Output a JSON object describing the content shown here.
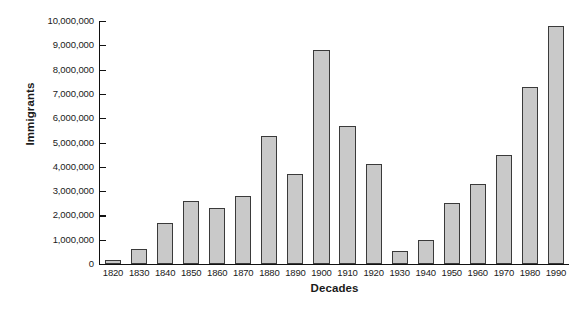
{
  "chart_data": {
    "type": "bar",
    "title": "",
    "xlabel": "Decades",
    "ylabel": "Immigrants",
    "categories": [
      "1820",
      "1830",
      "1840",
      "1850",
      "1860",
      "1870",
      "1880",
      "1890",
      "1900",
      "1910",
      "1920",
      "1930",
      "1940",
      "1950",
      "1960",
      "1970",
      "1980",
      "1990"
    ],
    "values": [
      150000,
      600000,
      1700000,
      2600000,
      2300000,
      2800000,
      5250000,
      3700000,
      8800000,
      5700000,
      4100000,
      550000,
      1000000,
      2500000,
      3300000,
      4500000,
      7300000,
      9800000
    ],
    "ylim": [
      0,
      10000000
    ],
    "ytick_values": [
      0,
      1000000,
      2000000,
      3000000,
      4000000,
      5000000,
      6000000,
      7000000,
      8000000,
      9000000,
      10000000
    ],
    "ytick_labels": [
      "0",
      "1,000,000",
      "2,000,000",
      "3,000,000",
      "4,000,000",
      "5,000,000",
      "6,000,000",
      "7,000,000",
      "8,000,000",
      "9,000,000",
      "10,000,000"
    ],
    "grid": false,
    "legend": null,
    "bar_color": "#c9c9c9",
    "bar_edge_color": "#3a3a3a",
    "axis_color": "#111111",
    "background_color": "#ffffff"
  }
}
